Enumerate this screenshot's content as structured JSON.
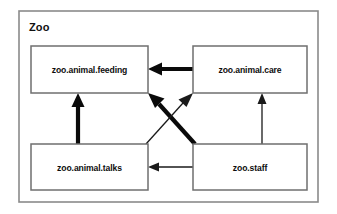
{
  "diagram": {
    "package": {
      "title": "Zoo",
      "frame": {
        "x": 19,
        "y": 11,
        "width": 299,
        "height": 191
      }
    },
    "nodes": [
      {
        "id": "feeding",
        "label": "zoo.animal.feeding",
        "x": 31,
        "y": 46,
        "width": 117,
        "height": 47
      },
      {
        "id": "care",
        "label": "zoo.animal.care",
        "x": 193,
        "y": 46,
        "width": 114,
        "height": 47
      },
      {
        "id": "talks",
        "label": "zoo.animal.talks",
        "x": 31,
        "y": 144,
        "width": 117,
        "height": 46
      },
      {
        "id": "staff",
        "label": "zoo.staff",
        "x": 193,
        "y": 144,
        "width": 114,
        "height": 46
      }
    ],
    "edges": [
      {
        "id": "care-to-feeding",
        "from": "care",
        "to": "feeding",
        "weight": "thick",
        "direction": "left",
        "x1": 193,
        "y1": 69,
        "x2": 150,
        "y2": 69
      },
      {
        "id": "talks-to-feeding",
        "from": "talks",
        "to": "feeding",
        "weight": "thick",
        "direction": "up",
        "x1": 78,
        "y1": 144,
        "x2": 78,
        "y2": 95
      },
      {
        "id": "staff-to-feeding",
        "from": "staff",
        "to": "feeding",
        "weight": "thick",
        "direction": "up-left",
        "x1": 194,
        "y1": 143,
        "x2": 150,
        "y2": 95
      },
      {
        "id": "talks-to-care",
        "from": "talks",
        "to": "care",
        "weight": "thin",
        "direction": "up-right",
        "x1": 147,
        "y1": 143,
        "x2": 191,
        "y2": 95
      },
      {
        "id": "staff-to-talks",
        "from": "staff",
        "to": "talks",
        "weight": "thin",
        "direction": "left",
        "x1": 193,
        "y1": 167,
        "x2": 150,
        "y2": 167
      },
      {
        "id": "staff-to-care",
        "from": "staff",
        "to": "care",
        "weight": "thin",
        "direction": "up",
        "x1": 262,
        "y1": 144,
        "x2": 262,
        "y2": 95
      }
    ],
    "colors": {
      "background": "#ffffff",
      "frame_stroke": "#8a8a8a",
      "node_stroke": "#6f6f6f",
      "arrow": "#0a0a0a",
      "text": "#0d0d0d"
    }
  }
}
